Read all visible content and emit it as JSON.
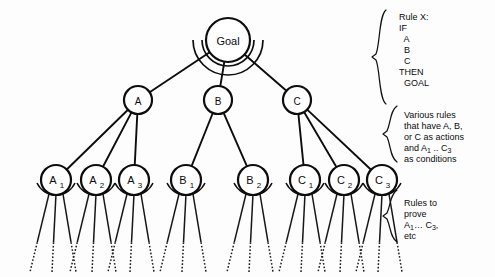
{
  "diagram": {
    "type": "and-or-tree",
    "colors": {
      "stroke": "#0d0d0d",
      "node_fill": "#ffffff",
      "background": "#fdfdfd",
      "text": "#0b0b0b"
    },
    "root": {
      "id": "goal",
      "label": "Goal",
      "cx": 228,
      "cy": 40,
      "r": 22,
      "font_size": 11,
      "has_and_arc": true
    },
    "level2": [
      {
        "id": "node-a",
        "label": "A",
        "cx": 138,
        "cy": 100,
        "r": 14,
        "font_size": 10,
        "children": 3
      },
      {
        "id": "node-b",
        "label": "B",
        "cx": 218,
        "cy": 100,
        "r": 14,
        "font_size": 10,
        "children": 2
      },
      {
        "id": "node-c",
        "label": "C",
        "cx": 297,
        "cy": 100,
        "r": 14,
        "font_size": 10,
        "children": 3
      }
    ],
    "level3": [
      {
        "id": "node-a1",
        "base": "A",
        "sub": "1",
        "parent": "node-a",
        "cx": 56,
        "cy": 180,
        "r": 15
      },
      {
        "id": "node-a2",
        "base": "A",
        "sub": "2",
        "parent": "node-a",
        "cx": 96,
        "cy": 180,
        "r": 15
      },
      {
        "id": "node-a3",
        "base": "A",
        "sub": "3",
        "parent": "node-a",
        "cx": 134,
        "cy": 180,
        "r": 15
      },
      {
        "id": "node-b1",
        "base": "B",
        "sub": "1",
        "parent": "node-b",
        "cx": 186,
        "cy": 180,
        "r": 15
      },
      {
        "id": "node-b2",
        "base": "B",
        "sub": "2",
        "parent": "node-b",
        "cx": 253,
        "cy": 180,
        "r": 15
      },
      {
        "id": "node-c1",
        "base": "C",
        "sub": "1",
        "parent": "node-c",
        "cx": 305,
        "cy": 180,
        "r": 15
      },
      {
        "id": "node-c2",
        "base": "C",
        "sub": "2",
        "parent": "node-c",
        "cx": 344,
        "cy": 180,
        "r": 15
      },
      {
        "id": "node-c3",
        "base": "C",
        "sub": "3",
        "parent": "node-c",
        "cx": 382,
        "cy": 180,
        "r": 15
      }
    ],
    "leaf_stems_per_node": 3,
    "leaf_stem_bottom_y": 272
  },
  "annotations": {
    "rule_x": {
      "name": "rule-x-annotation",
      "x": 399,
      "y": 12,
      "brace": {
        "x": 377,
        "top": 10,
        "bottom": 104
      },
      "lines": [
        "Rule X:",
        "IF",
        "  A",
        "  B",
        "  C",
        "THEN",
        "  GOAL"
      ]
    },
    "various_rules": {
      "name": "various-rules-annotation",
      "x": 404,
      "y": 110,
      "brace": {
        "x": 388,
        "top": 106,
        "bottom": 162
      },
      "lines": [
        "Various rules",
        "that have A, B,",
        "or C as actions",
        "and A₁ .. C₃",
        "as conditions"
      ],
      "lines_rich": [
        {
          "text": "Various rules"
        },
        {
          "text": "that have A, B,"
        },
        {
          "text": "or C as actions"
        },
        {
          "text": "and A",
          "sub": "1",
          "text2": " .. C",
          "sub2": "3"
        },
        {
          "text": "as conditions"
        }
      ]
    },
    "rules_to_prove": {
      "name": "rules-to-prove-annotation",
      "x": 404,
      "y": 198,
      "brace": {
        "x": 388,
        "top": 190,
        "bottom": 242
      },
      "lines": [
        "Rules to",
        "prove",
        "A₁… C₃,",
        "etc"
      ],
      "lines_rich": [
        {
          "text": "Rules to"
        },
        {
          "text": "prove"
        },
        {
          "text": "A",
          "sub": "1",
          "text2": "… C",
          "sub2": "3",
          "text3": ","
        },
        {
          "text": "etc"
        }
      ]
    }
  }
}
